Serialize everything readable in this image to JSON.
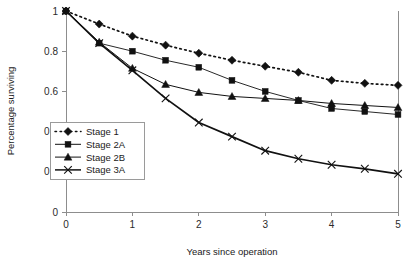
{
  "chart_data": {
    "type": "line",
    "title": "",
    "xlabel": "Years since operation",
    "ylabel": "Percentage surviving",
    "xlim": [
      0,
      5
    ],
    "ylim": [
      0,
      1
    ],
    "xticks": [
      "0",
      "1",
      "2",
      "3",
      "4",
      "5"
    ],
    "yticks": [
      "0",
      "0.2",
      "0.4",
      "0.6",
      "0.8",
      "1"
    ],
    "grid": false,
    "legend_position": "inner-left",
    "x": [
      0,
      0.5,
      1,
      1.5,
      2,
      2.5,
      3,
      3.5,
      4,
      4.5,
      5
    ],
    "series": [
      {
        "name": "Stage 1",
        "marker": "diamond",
        "linestyle": "dotted",
        "color": "#111111",
        "values": [
          1.0,
          0.935,
          0.875,
          0.83,
          0.79,
          0.755,
          0.725,
          0.695,
          0.655,
          0.64,
          0.63
        ]
      },
      {
        "name": "Stage 2A",
        "marker": "square",
        "linestyle": "solid",
        "color": "#111111",
        "values": [
          1.0,
          0.84,
          0.8,
          0.755,
          0.72,
          0.655,
          0.6,
          0.555,
          0.515,
          0.5,
          0.485
        ]
      },
      {
        "name": "Stage 2B",
        "marker": "triangle",
        "linestyle": "solid",
        "color": "#111111",
        "values": [
          1.0,
          0.845,
          0.715,
          0.635,
          0.595,
          0.575,
          0.565,
          0.555,
          0.54,
          0.53,
          0.52
        ]
      },
      {
        "name": "Stage 3A",
        "marker": "x",
        "linestyle": "solid",
        "color": "#111111",
        "values": [
          1.0,
          0.84,
          0.705,
          0.565,
          0.445,
          0.375,
          0.305,
          0.265,
          0.235,
          0.215,
          0.19
        ]
      }
    ]
  },
  "legend": {
    "items": [
      {
        "label": "Stage 1"
      },
      {
        "label": "Stage 2A"
      },
      {
        "label": "Stage 2B"
      },
      {
        "label": "Stage 3A"
      }
    ]
  },
  "axes": {
    "x_title": "Years since operation",
    "y_title": "Percentage surviving",
    "x_tick_labels": [
      "0",
      "1",
      "2",
      "3",
      "4",
      "5"
    ],
    "y_tick_labels": [
      "0",
      "0.2",
      "0.4",
      "0.6",
      "0.8",
      "1"
    ]
  }
}
